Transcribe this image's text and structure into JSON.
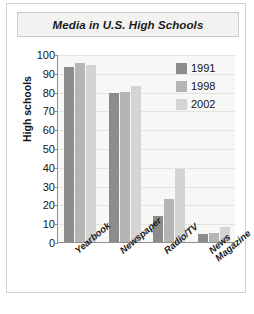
{
  "figure": {
    "title": "Media in U.S. High Schools"
  },
  "chart_data": {
    "type": "bar",
    "title": "Media in U.S. High Schools",
    "xlabel": "",
    "ylabel": "High schools",
    "categories": [
      "Yearbook",
      "Newspaper",
      "Radio/TV",
      "News\nMagazine"
    ],
    "series": [
      {
        "name": "1991",
        "color": "#8c8c8c",
        "values": [
          93,
          79,
          14,
          4
        ]
      },
      {
        "name": "1998",
        "color": "#b5b5b5",
        "values": [
          95,
          80,
          23,
          5
        ]
      },
      {
        "name": "2002",
        "color": "#d4d4d4",
        "values": [
          94,
          83,
          39,
          8
        ]
      }
    ],
    "ylim": [
      0,
      100
    ],
    "yticks": [
      0,
      10,
      20,
      30,
      40,
      50,
      60,
      70,
      80,
      90,
      100
    ],
    "ytick_labels": [
      "0",
      "10",
      "20",
      "30",
      "40",
      "50",
      "60",
      "70",
      "80",
      "90",
      "100"
    ],
    "grid": true,
    "legend_position": "top-right",
    "plot_background": "#f7f7f5"
  }
}
